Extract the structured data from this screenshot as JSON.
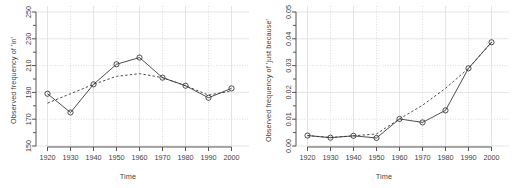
{
  "figure": {
    "panels": [
      "left-panel",
      "right-panel"
    ],
    "line_color": "#3a3a3a",
    "grid_color": "#d8d8d8",
    "background": "#ffffff"
  },
  "chart_data": [
    {
      "id": "left",
      "type": "line",
      "title": "",
      "xlabel": "Time",
      "ylabel": "Observed frequency of 'in'",
      "x": [
        1920,
        1930,
        1940,
        1950,
        1960,
        1970,
        1980,
        1990,
        2000
      ],
      "xticks": [
        "1920",
        "1930",
        "1940",
        "1950",
        "1960",
        "1970",
        "1980",
        "1990",
        "2000"
      ],
      "yticks": [
        "150",
        "170",
        "190",
        "210",
        "230",
        "250"
      ],
      "ytick_values": [
        150,
        170,
        190,
        210,
        230,
        250
      ],
      "xlim": [
        1915,
        2005
      ],
      "ylim": [
        150,
        250
      ],
      "grid": true,
      "legend": "none",
      "series": [
        {
          "name": "observed",
          "style": "solid",
          "marker": "open-circle",
          "values": [
            189,
            175,
            196,
            211,
            216,
            201,
            195,
            186,
            193
          ]
        },
        {
          "name": "fitted",
          "style": "dashed",
          "marker": "none",
          "values": [
            182,
            189,
            196,
            202,
            204,
            201,
            195,
            188,
            191
          ]
        }
      ]
    },
    {
      "id": "right",
      "type": "line",
      "title": "",
      "xlabel": "Time",
      "ylabel": "Observed frequency of 'just because'",
      "x": [
        1920,
        1930,
        1940,
        1950,
        1960,
        1970,
        1980,
        1990,
        2000
      ],
      "xticks": [
        "1920",
        "1930",
        "1940",
        "1950",
        "1960",
        "1970",
        "1980",
        "1990",
        "2000"
      ],
      "yticks": [
        "0.00",
        "0.01",
        "0.02",
        "0.03",
        "0.04",
        "0.05"
      ],
      "ytick_values": [
        0.0,
        0.01,
        0.02,
        0.03,
        0.04,
        0.05
      ],
      "xlim": [
        1915,
        2005
      ],
      "ylim": [
        0.0,
        0.05
      ],
      "grid": true,
      "legend": "none",
      "series": [
        {
          "name": "observed",
          "style": "solid",
          "marker": "open-circle",
          "values": [
            0.0039,
            0.0031,
            0.0038,
            0.003,
            0.0101,
            0.0088,
            0.0133,
            0.029,
            0.0387
          ]
        },
        {
          "name": "fitted",
          "style": "dashed",
          "marker": "none",
          "values": [
            0.0039,
            0.0032,
            0.0038,
            0.0045,
            0.0101,
            0.0152,
            0.0215,
            0.029,
            0.0387
          ]
        }
      ]
    }
  ]
}
